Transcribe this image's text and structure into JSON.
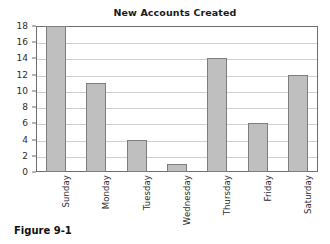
{
  "figure": {
    "caption": "Figure 9-1"
  },
  "chart_data": {
    "type": "bar",
    "title": "New Accounts Created",
    "xlabel": "",
    "ylabel": "",
    "categories": [
      "Sunday",
      "Monday",
      "Tuesday",
      "Wednesday",
      "Thursday",
      "Friday",
      "Saturday"
    ],
    "values": [
      18,
      11,
      4,
      1,
      14,
      6,
      12
    ],
    "ylim": [
      0,
      18
    ],
    "ytick_step": 2,
    "yticks": [
      0,
      2,
      4,
      6,
      8,
      10,
      12,
      14,
      16,
      18
    ],
    "ytick_labels": [
      "0",
      "2",
      "4",
      "6",
      "8",
      "10",
      "12",
      "14",
      "16",
      "18"
    ],
    "grid": true,
    "grid_axis": "y",
    "legend": false,
    "bar_color": "#bfbfbf",
    "bar_edge_color": "#7d7d7d",
    "frame_color": "#6e6e6e",
    "gridline_color": "#cfcfcf",
    "xtick_rotation": 90
  }
}
